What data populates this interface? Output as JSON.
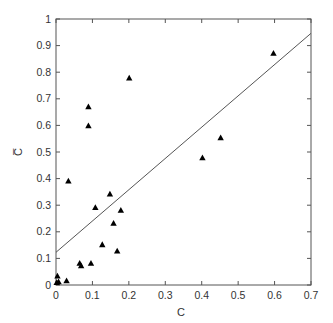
{
  "chart_data": {
    "type": "scatter",
    "title": "",
    "xlabel": "C",
    "ylabel": "C̅",
    "xlim": [
      0,
      0.7
    ],
    "ylim": [
      0,
      1
    ],
    "grid": false,
    "legend": null,
    "x_ticks": [
      0,
      0.1,
      0.2,
      0.3,
      0.4,
      0.5,
      0.6,
      0.7
    ],
    "x_tick_labels": [
      "0",
      "0.1",
      "0.2",
      "0.3",
      "0.4",
      "0.5",
      "0.6",
      "0.7"
    ],
    "y_ticks": [
      0,
      0.1,
      0.2,
      0.3,
      0.4,
      0.5,
      0.6,
      0.7,
      0.8,
      0.9,
      1
    ],
    "y_tick_labels": [
      "0",
      "0.1",
      "0.2",
      "0.3",
      "0.4",
      "0.5",
      "0.6",
      "0.7",
      "0.8",
      "0.9",
      "1"
    ],
    "marker": "triangle",
    "marker_color": "#000000",
    "series": [
      {
        "name": "data",
        "points": [
          {
            "x": 0.002,
            "y": 0.01
          },
          {
            "x": 0.004,
            "y": 0.034
          },
          {
            "x": 0.007,
            "y": 0.012
          },
          {
            "x": 0.029,
            "y": 0.016
          },
          {
            "x": 0.034,
            "y": 0.391
          },
          {
            "x": 0.065,
            "y": 0.082
          },
          {
            "x": 0.069,
            "y": 0.073
          },
          {
            "x": 0.089,
            "y": 0.67
          },
          {
            "x": 0.089,
            "y": 0.599
          },
          {
            "x": 0.096,
            "y": 0.082
          },
          {
            "x": 0.108,
            "y": 0.292
          },
          {
            "x": 0.127,
            "y": 0.152
          },
          {
            "x": 0.148,
            "y": 0.342
          },
          {
            "x": 0.158,
            "y": 0.232
          },
          {
            "x": 0.168,
            "y": 0.128
          },
          {
            "x": 0.178,
            "y": 0.281
          },
          {
            "x": 0.201,
            "y": 0.778
          },
          {
            "x": 0.402,
            "y": 0.479
          },
          {
            "x": 0.452,
            "y": 0.554
          },
          {
            "x": 0.597,
            "y": 0.871
          }
        ]
      }
    ],
    "fit_line": {
      "intercept": 0.123,
      "slope": 1.176,
      "x_range": [
        0,
        0.7
      ],
      "color": "#555555"
    },
    "colors": {
      "axis": "#555555",
      "text": "#333333",
      "marker": "#000000"
    }
  }
}
